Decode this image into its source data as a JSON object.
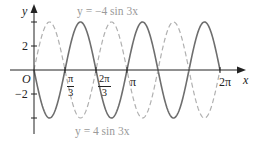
{
  "chart_data": {
    "type": "line",
    "title": "",
    "xlabel": "x",
    "ylabel": "y",
    "origin_label": "O",
    "xlim": [
      0,
      6.2832
    ],
    "ylim": [
      -4,
      4
    ],
    "grid": false,
    "x_ticks": [
      {
        "value": 1.0472,
        "label_num": "π",
        "label_den": "3"
      },
      {
        "value": 2.0944,
        "label_num": "2π",
        "label_den": "3"
      },
      {
        "value": 3.1416,
        "label": "π"
      },
      {
        "value": 6.2832,
        "label": "2π"
      }
    ],
    "y_ticks": [
      {
        "value": 4,
        "label": ""
      },
      {
        "value": 2,
        "label": "2"
      },
      {
        "value": -2,
        "label": "−2"
      },
      {
        "value": -4,
        "label": ""
      }
    ],
    "series": [
      {
        "name": "y = −4 sin 3x",
        "style": "solid",
        "color": "#6e6e6e",
        "amplitude": -4,
        "frequency": 3,
        "x": [
          0,
          0.5236,
          1.0472,
          1.5708,
          2.0944,
          2.618,
          3.1416,
          3.6652,
          4.1888,
          4.7124,
          5.236,
          5.7596,
          6.2832
        ],
        "values": [
          0,
          -4,
          0,
          4,
          0,
          -4,
          0,
          4,
          0,
          -4,
          0,
          4,
          0
        ]
      },
      {
        "name": "y = 4 sin 3x",
        "style": "dashed",
        "color": "#b0b0b0",
        "amplitude": 4,
        "frequency": 3,
        "x": [
          0,
          0.5236,
          1.0472,
          1.5708,
          2.0944,
          2.618,
          3.1416,
          3.6652,
          4.1888,
          4.7124,
          5.236,
          5.7596,
          6.2832
        ],
        "values": [
          0,
          4,
          0,
          -4,
          0,
          4,
          0,
          -4,
          0,
          4,
          0,
          -4,
          0
        ]
      }
    ],
    "annotations": [
      {
        "text": "y = −4 sin 3x",
        "position": "top"
      },
      {
        "text": "y = 4 sin 3x",
        "position": "bottom"
      }
    ]
  },
  "labels": {
    "y_axis": "y",
    "x_axis": "x",
    "origin": "O",
    "tick_2": "2",
    "tick_neg2": "−2",
    "pi_third_num": "π",
    "pi_third_den": "3",
    "two_pi_third_num": "2π",
    "two_pi_third_den": "3",
    "pi": "π",
    "two_pi": "2π",
    "top_curve_label": "y = −4 sin 3x",
    "bottom_curve_label": "y = 4 sin 3x"
  }
}
